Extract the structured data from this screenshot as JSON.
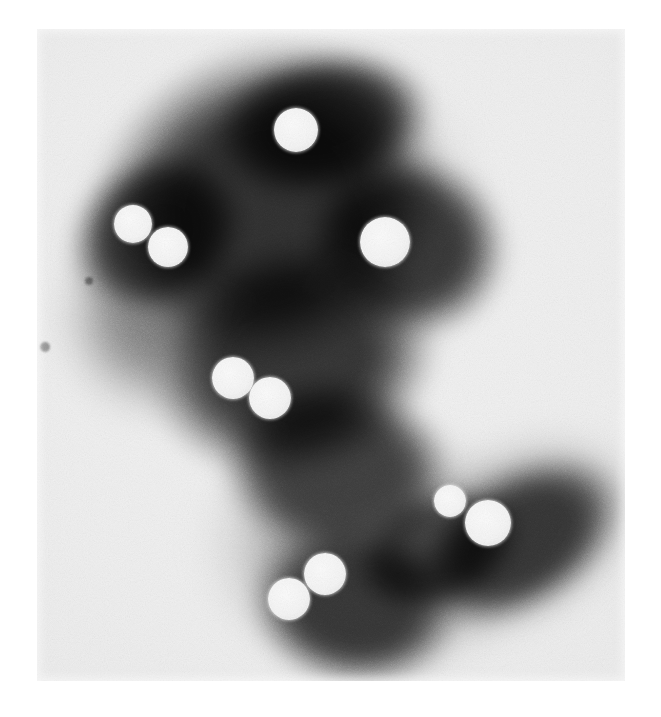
{
  "image": {
    "kind": "electron-micrograph",
    "title": "Negatively stained particle cluster micrograph",
    "alt_text": "Grayscale electron micrograph showing a dark irregular stained mass with nine bright circular particles",
    "width": 661,
    "height": 717,
    "colors": {
      "page_background": "#ffffff",
      "plate_background": "#ececec",
      "stain_dark": "#2f2f2f",
      "stain_mid": "#4a4a4a",
      "stain_light": "#8c8c8c",
      "spot_fill": "#f6f6f6"
    },
    "plate": {
      "x": 37,
      "y": 29,
      "width": 588,
      "height": 652
    },
    "grain": {
      "opacity": 0.5,
      "description": "film grain"
    }
  },
  "mass": {
    "label": "stained-specimen-mass",
    "description": "Large dark diamond-shaped upper body with a lower-right lobe and a lower-centre lobe",
    "lobes": [
      {
        "name": "upper-body",
        "cx": 230,
        "cy": 175,
        "rx": 185,
        "ry": 160,
        "rot": -28,
        "tone": "#2f2f2f"
      },
      {
        "name": "upper-left-wing",
        "cx": 120,
        "cy": 205,
        "rx": 95,
        "ry": 80,
        "rot": -35,
        "tone": "#3a3a3a"
      },
      {
        "name": "upper-right-wing",
        "cx": 370,
        "cy": 215,
        "rx": 105,
        "ry": 95,
        "rot": 20,
        "tone": "#363636"
      },
      {
        "name": "top-cap",
        "cx": 285,
        "cy": 95,
        "rx": 115,
        "ry": 75,
        "rot": -12,
        "tone": "#343434"
      },
      {
        "name": "mid-body",
        "cx": 255,
        "cy": 330,
        "rx": 150,
        "ry": 120,
        "rot": -15,
        "tone": "#333333"
      },
      {
        "name": "lower-bridge",
        "cx": 300,
        "cy": 440,
        "rx": 120,
        "ry": 95,
        "rot": 10,
        "tone": "#3d3d3d"
      },
      {
        "name": "lower-centre-lobe",
        "cx": 318,
        "cy": 575,
        "rx": 110,
        "ry": 85,
        "rot": 8,
        "tone": "#353535"
      },
      {
        "name": "lower-right-lobe",
        "cx": 482,
        "cy": 512,
        "rx": 120,
        "ry": 72,
        "rot": -32,
        "tone": "#343434"
      },
      {
        "name": "lobe-connector",
        "cx": 400,
        "cy": 520,
        "rx": 90,
        "ry": 60,
        "rot": -20,
        "tone": "#454545"
      }
    ],
    "halos": [
      {
        "name": "halo-upper",
        "cx": 240,
        "cy": 210,
        "rx": 225,
        "ry": 195,
        "rot": -25,
        "tone": "#7b7b7b"
      },
      {
        "name": "halo-left",
        "cx": 120,
        "cy": 290,
        "rx": 110,
        "ry": 110,
        "rot": 0,
        "tone": "#9a9a9a"
      },
      {
        "name": "halo-lower",
        "cx": 330,
        "cy": 520,
        "rx": 175,
        "ry": 140,
        "rot": 5,
        "tone": "#8d8d8d"
      },
      {
        "name": "halo-right",
        "cx": 480,
        "cy": 505,
        "rx": 145,
        "ry": 100,
        "rot": -30,
        "tone": "#8a8a8a"
      }
    ],
    "flecks": [
      {
        "name": "fleck-left-margin",
        "cx": 8,
        "cy": 318,
        "r": 5
      },
      {
        "name": "fleck-left-upper",
        "cx": 52,
        "cy": 252,
        "r": 4
      }
    ]
  },
  "particles": {
    "label": "bright-particles",
    "count": 9,
    "groups": [
      {
        "name": "solo-top",
        "members": [
          "p1"
        ]
      },
      {
        "name": "pair-upper-left",
        "members": [
          "p2",
          "p3"
        ]
      },
      {
        "name": "solo-upper-right",
        "members": [
          "p4"
        ]
      },
      {
        "name": "pair-middle",
        "members": [
          "p5",
          "p6"
        ]
      },
      {
        "name": "pair-lower-right",
        "members": [
          "p7",
          "p8"
        ]
      },
      {
        "name": "pair-lower-centre",
        "members": [
          "p9",
          "p10"
        ]
      }
    ],
    "items": [
      {
        "id": "p1",
        "name": "particle-top",
        "cx": 259,
        "cy": 101,
        "r": 22
      },
      {
        "id": "p2",
        "name": "particle-upper-left-a",
        "cx": 96,
        "cy": 195,
        "r": 19
      },
      {
        "id": "p3",
        "name": "particle-upper-left-b",
        "cx": 131,
        "cy": 218,
        "r": 20
      },
      {
        "id": "p4",
        "name": "particle-upper-right",
        "cx": 348,
        "cy": 213,
        "r": 25
      },
      {
        "id": "p5",
        "name": "particle-middle-a",
        "cx": 196,
        "cy": 349,
        "r": 21
      },
      {
        "id": "p6",
        "name": "particle-middle-b",
        "cx": 233,
        "cy": 369,
        "r": 21
      },
      {
        "id": "p7",
        "name": "particle-lower-right-small",
        "cx": 413,
        "cy": 472,
        "r": 16
      },
      {
        "id": "p8",
        "name": "particle-lower-right-large",
        "cx": 451,
        "cy": 494,
        "r": 23
      },
      {
        "id": "p9",
        "name": "particle-lower-centre-a",
        "cx": 288,
        "cy": 545,
        "r": 21
      },
      {
        "id": "p10",
        "name": "particle-lower-centre-b",
        "cx": 252,
        "cy": 570,
        "r": 21
      }
    ]
  }
}
